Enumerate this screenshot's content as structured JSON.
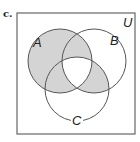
{
  "figure": {
    "part_label": "c.",
    "universe_label": "U",
    "sets": [
      {
        "name": "A",
        "cx": 60,
        "cy": 61,
        "r": 32
      },
      {
        "name": "B",
        "cx": 94,
        "cy": 61,
        "r": 32
      },
      {
        "name": "C",
        "cx": 77,
        "cy": 89,
        "r": 32
      }
    ],
    "shaded_regions": [
      "A only",
      "A∩B not C",
      "A∩C not B",
      "B∩C not A"
    ],
    "unshaded_regions": [
      "B only",
      "C only",
      "A∩B∩C",
      "outside"
    ],
    "colors": {
      "shade": "#d4d4d4",
      "stroke": "#555555",
      "box": "#666666"
    }
  }
}
